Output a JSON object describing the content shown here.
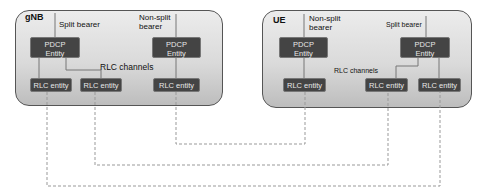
{
  "gnb": {
    "label": "gNB",
    "split_bearer_label": "Split bearer",
    "non_split_bearer_label": "Non-split bearer",
    "rlc_channels_label": "RLC channels",
    "pdcp_entities": [
      {
        "line1": "PDCP",
        "line2": "Entity"
      },
      {
        "line1": "PDCP",
        "line2": "Entity"
      }
    ],
    "rlc_entities": [
      "RLC entity",
      "RLC entity",
      "RLC entity"
    ]
  },
  "ue": {
    "label": "UE",
    "split_bearer_label": "Split bearer",
    "non_split_bearer_label": "Non-split bearer",
    "rlc_channels_label": "RLC channels",
    "pdcp_entities": [
      {
        "line1": "PDCP",
        "line2": "Entity"
      },
      {
        "line1": "PDCP",
        "line2": "Entity"
      }
    ],
    "rlc_entities": [
      "RLC entity",
      "RLC entity",
      "RLC entity"
    ]
  },
  "colors": {
    "entity_fill": "#444444",
    "entity_text": "#e8e8e8",
    "connector": "#777777",
    "dashed_link": "#999999"
  }
}
